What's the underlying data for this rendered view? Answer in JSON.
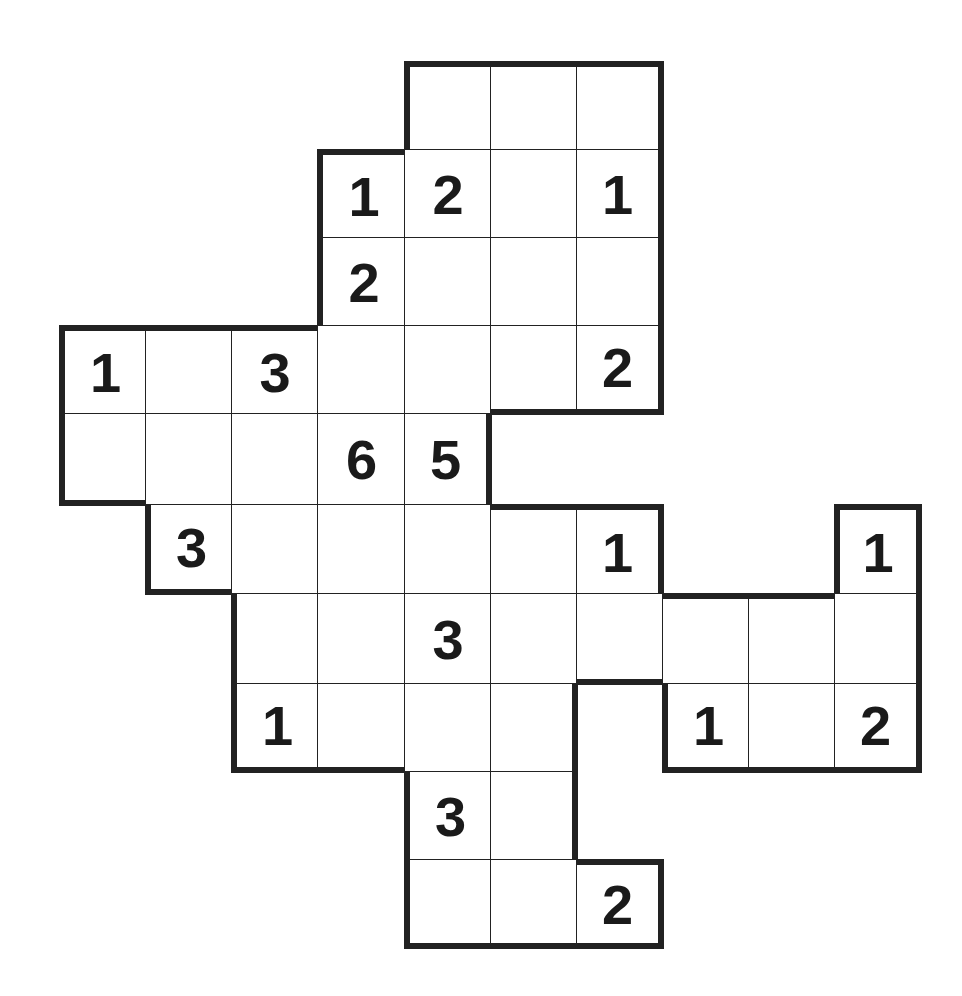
{
  "puzzle": {
    "type": "number-grid-puzzle",
    "grid": {
      "origin_x": 60,
      "origin_y": 62,
      "col_x": [
        60,
        146,
        232,
        318,
        405,
        491,
        577,
        663,
        749,
        835,
        921
      ],
      "row_y": [
        62,
        150,
        238,
        326,
        414,
        505,
        594,
        684,
        772,
        860,
        948
      ]
    },
    "cells": [
      {
        "r": 0,
        "c": 4,
        "v": ""
      },
      {
        "r": 0,
        "c": 5,
        "v": ""
      },
      {
        "r": 0,
        "c": 6,
        "v": ""
      },
      {
        "r": 1,
        "c": 3,
        "v": "1"
      },
      {
        "r": 1,
        "c": 4,
        "v": "2"
      },
      {
        "r": 1,
        "c": 5,
        "v": ""
      },
      {
        "r": 1,
        "c": 6,
        "v": "1"
      },
      {
        "r": 2,
        "c": 3,
        "v": "2"
      },
      {
        "r": 2,
        "c": 4,
        "v": ""
      },
      {
        "r": 2,
        "c": 5,
        "v": ""
      },
      {
        "r": 2,
        "c": 6,
        "v": ""
      },
      {
        "r": 3,
        "c": 0,
        "v": "1"
      },
      {
        "r": 3,
        "c": 1,
        "v": ""
      },
      {
        "r": 3,
        "c": 2,
        "v": "3"
      },
      {
        "r": 3,
        "c": 3,
        "v": ""
      },
      {
        "r": 3,
        "c": 4,
        "v": ""
      },
      {
        "r": 3,
        "c": 5,
        "v": ""
      },
      {
        "r": 3,
        "c": 6,
        "v": "2"
      },
      {
        "r": 4,
        "c": 0,
        "v": ""
      },
      {
        "r": 4,
        "c": 1,
        "v": ""
      },
      {
        "r": 4,
        "c": 2,
        "v": ""
      },
      {
        "r": 4,
        "c": 3,
        "v": "6"
      },
      {
        "r": 4,
        "c": 4,
        "v": "5"
      },
      {
        "r": 5,
        "c": 1,
        "v": "3"
      },
      {
        "r": 5,
        "c": 2,
        "v": ""
      },
      {
        "r": 5,
        "c": 3,
        "v": ""
      },
      {
        "r": 5,
        "c": 4,
        "v": ""
      },
      {
        "r": 5,
        "c": 5,
        "v": ""
      },
      {
        "r": 5,
        "c": 6,
        "v": "1"
      },
      {
        "r": 5,
        "c": 9,
        "v": "1"
      },
      {
        "r": 6,
        "c": 2,
        "v": ""
      },
      {
        "r": 6,
        "c": 3,
        "v": ""
      },
      {
        "r": 6,
        "c": 4,
        "v": "3"
      },
      {
        "r": 6,
        "c": 5,
        "v": ""
      },
      {
        "r": 6,
        "c": 6,
        "v": ""
      },
      {
        "r": 6,
        "c": 7,
        "v": ""
      },
      {
        "r": 6,
        "c": 8,
        "v": ""
      },
      {
        "r": 6,
        "c": 9,
        "v": ""
      },
      {
        "r": 7,
        "c": 2,
        "v": "1"
      },
      {
        "r": 7,
        "c": 3,
        "v": ""
      },
      {
        "r": 7,
        "c": 4,
        "v": ""
      },
      {
        "r": 7,
        "c": 5,
        "v": ""
      },
      {
        "r": 7,
        "c": 7,
        "v": "1"
      },
      {
        "r": 7,
        "c": 8,
        "v": ""
      },
      {
        "r": 7,
        "c": 9,
        "v": "2"
      },
      {
        "r": 8,
        "c": 4,
        "v": "3"
      },
      {
        "r": 8,
        "c": 5,
        "v": ""
      },
      {
        "r": 9,
        "c": 4,
        "v": ""
      },
      {
        "r": 9,
        "c": 5,
        "v": ""
      },
      {
        "r": 9,
        "c": 6,
        "v": "2"
      }
    ]
  }
}
